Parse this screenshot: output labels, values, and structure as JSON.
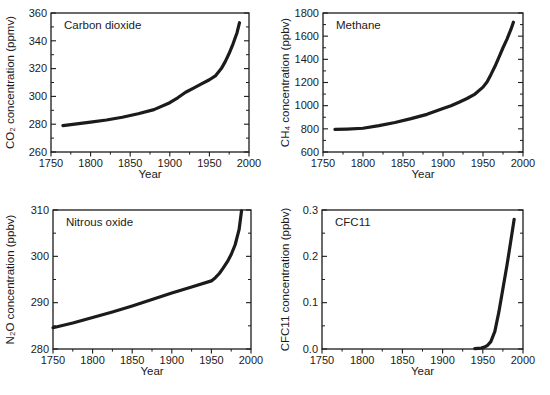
{
  "page": {
    "background": "#ffffff",
    "ink": "#1b1b1b"
  },
  "chart_data": [
    {
      "type": "line",
      "title": "Carbon dioxide",
      "xlabel": "Year",
      "ylabel": "CO₂ concentration (ppmv)",
      "xlim": [
        1750,
        2000
      ],
      "ylim": [
        260,
        360
      ],
      "xtick_values": [
        1750,
        1800,
        1850,
        1900,
        1950,
        2000
      ],
      "xtick_labels": [
        "1750",
        "1800",
        "1850",
        "1900",
        "1950",
        "2000"
      ],
      "x_minor_step": 25,
      "ytick_values": [
        260,
        280,
        300,
        320,
        340,
        360
      ],
      "ytick_labels": [
        "260",
        "280",
        "300",
        "320",
        "340",
        "360"
      ],
      "y_minor_step": 10,
      "grid": false,
      "legend": "none",
      "series": [
        {
          "name": "CO2",
          "x": [
            1765,
            1780,
            1800,
            1820,
            1840,
            1860,
            1880,
            1900,
            1910,
            1920,
            1930,
            1940,
            1950,
            1958,
            1965,
            1970,
            1975,
            1980,
            1985,
            1988
          ],
          "y": [
            279,
            280,
            281.5,
            283,
            285,
            287.5,
            290.5,
            295.5,
            299,
            303,
            306,
            309,
            312,
            315,
            320,
            325,
            331,
            338,
            346,
            353
          ]
        }
      ]
    },
    {
      "type": "line",
      "title": "Methane",
      "xlabel": "Year",
      "ylabel": "CH₄ concentration (ppbv)",
      "xlim": [
        1750,
        2000
      ],
      "ylim": [
        600,
        1800
      ],
      "xtick_values": [
        1750,
        1800,
        1850,
        1900,
        1950,
        2000
      ],
      "xtick_labels": [
        "1750",
        "1800",
        "1850",
        "1900",
        "1950",
        "2000"
      ],
      "x_minor_step": 25,
      "ytick_values": [
        600,
        800,
        1000,
        1200,
        1400,
        1600,
        1800
      ],
      "ytick_labels": [
        "600",
        "800",
        "1000",
        "1200",
        "1400",
        "1600",
        "1800"
      ],
      "y_minor_step": 100,
      "grid": false,
      "legend": "none",
      "series": [
        {
          "name": "CH4",
          "x": [
            1765,
            1780,
            1800,
            1820,
            1840,
            1860,
            1880,
            1900,
            1910,
            1920,
            1930,
            1940,
            1950,
            1955,
            1960,
            1965,
            1970,
            1975,
            1980,
            1985,
            1988
          ],
          "y": [
            795,
            798,
            805,
            828,
            855,
            888,
            925,
            975,
            1000,
            1030,
            1062,
            1100,
            1160,
            1205,
            1270,
            1340,
            1420,
            1500,
            1575,
            1660,
            1720
          ]
        }
      ]
    },
    {
      "type": "line",
      "title": "Nitrous oxide",
      "xlabel": "Year",
      "ylabel": "N₂O concentration (ppbv)",
      "xlim": [
        1750,
        2000
      ],
      "ylim": [
        280,
        310
      ],
      "xtick_values": [
        1750,
        1800,
        1850,
        1900,
        1950,
        2000
      ],
      "xtick_labels": [
        "1750",
        "1800",
        "1850",
        "1900",
        "1950",
        "2000"
      ],
      "x_minor_step": 25,
      "ytick_values": [
        280,
        290,
        300,
        310
      ],
      "ytick_labels": [
        "280",
        "290",
        "300",
        "310"
      ],
      "y_minor_step": 5,
      "grid": false,
      "legend": "none",
      "series": [
        {
          "name": "N2O",
          "x": [
            1750,
            1775,
            1800,
            1825,
            1850,
            1875,
            1900,
            1925,
            1950,
            1955,
            1960,
            1965,
            1970,
            1975,
            1980,
            1985,
            1988
          ],
          "y": [
            284.6,
            285.6,
            286.8,
            288.0,
            289.3,
            290.7,
            292.1,
            293.4,
            294.7,
            295.4,
            296.3,
            297.5,
            298.8,
            300.4,
            302.5,
            305.8,
            309.8
          ]
        }
      ]
    },
    {
      "type": "line",
      "title": "CFC11",
      "xlabel": "Year",
      "ylabel": "CFC11 concentration (ppbv)",
      "xlim": [
        1750,
        2000
      ],
      "ylim": [
        0,
        0.3
      ],
      "xtick_values": [
        1750,
        1800,
        1850,
        1900,
        1950,
        2000
      ],
      "xtick_labels": [
        "1750",
        "1800",
        "1850",
        "1900",
        "1950",
        "2000"
      ],
      "x_minor_step": 25,
      "ytick_values": [
        0,
        0.1,
        0.2,
        0.3
      ],
      "ytick_labels": [
        "0.0",
        "0.1",
        "0.2",
        "0.3"
      ],
      "y_minor_step": 0.05,
      "grid": false,
      "legend": "none",
      "series": [
        {
          "name": "CFC11",
          "x": [
            1940,
            1948,
            1952,
            1956,
            1960,
            1965,
            1970,
            1975,
            1980,
            1985,
            1989
          ],
          "y": [
            0.001,
            0.002,
            0.004,
            0.008,
            0.016,
            0.038,
            0.08,
            0.13,
            0.18,
            0.235,
            0.28
          ]
        }
      ]
    }
  ]
}
